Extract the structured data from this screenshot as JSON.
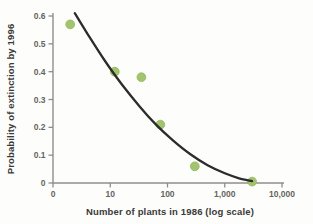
{
  "figure": {
    "background_color": "#fdfdfb",
    "kind": "scatter plot with fitted curve"
  },
  "chart_data": {
    "type": "scatter",
    "title": "",
    "xlabel": "Number of plants in 1986 (log scale)",
    "ylabel": "Probability of extinction by 1996",
    "x_scale": "log",
    "ylim": [
      0,
      0.62
    ],
    "grid": "off",
    "legend": "none",
    "x_ticks": {
      "labels": [
        "0",
        "10",
        "100",
        "1,000",
        "10,000"
      ],
      "log_positions": [
        0,
        1,
        2,
        3,
        4
      ]
    },
    "y_ticks": {
      "labels": [
        "0",
        "0.1",
        "0.2",
        "0.3",
        "0.4",
        "0.5",
        "0.6"
      ],
      "values": [
        0,
        0.1,
        0.2,
        0.3,
        0.4,
        0.5,
        0.6
      ]
    },
    "points": [
      {
        "x": 2,
        "y": 0.57
      },
      {
        "x": 12,
        "y": 0.4
      },
      {
        "x": 35,
        "y": 0.38
      },
      {
        "x": 75,
        "y": 0.21
      },
      {
        "x": 300,
        "y": 0.06
      },
      {
        "x": 3000,
        "y": 0.005
      }
    ],
    "fitted_curve": [
      [
        2.4,
        0.61
      ],
      [
        4,
        0.536
      ],
      [
        8,
        0.44
      ],
      [
        16,
        0.354
      ],
      [
        32,
        0.277
      ],
      [
        63,
        0.21
      ],
      [
        126,
        0.152
      ],
      [
        251,
        0.103
      ],
      [
        501,
        0.064
      ],
      [
        1000,
        0.035
      ],
      [
        1780,
        0.017
      ],
      [
        3000,
        0.007
      ]
    ],
    "colors": {
      "point_fill": "#a3c46f",
      "point_stroke": "#93b75c",
      "curve": "#2d2c2a",
      "axis": "#8f8f8a",
      "tick_label": "#64645f",
      "axis_title": "#3a3a38"
    }
  }
}
